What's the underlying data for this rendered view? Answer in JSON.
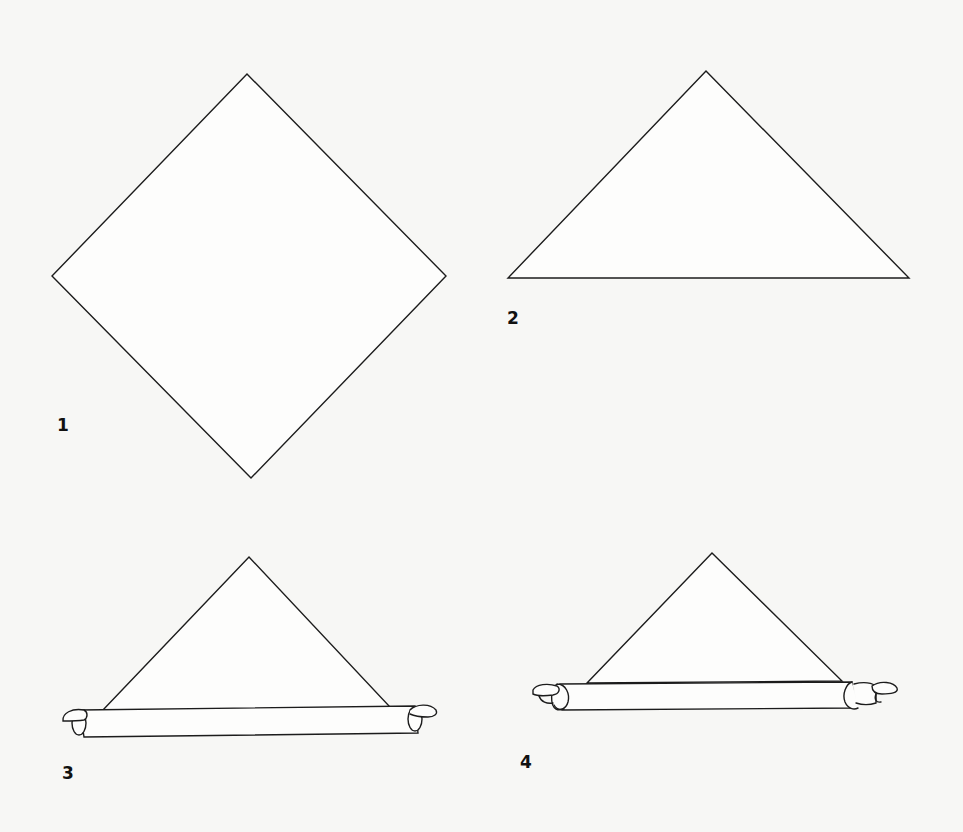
{
  "diagram": {
    "type": "step-by-step folding/rolling instructions",
    "background_color": "#f7f7f5",
    "line_color": "#1c1c1c",
    "steps": [
      {
        "label": "1",
        "shape": "square turned on point (diamond)",
        "vertices": {
          "top": [
            247,
            74
          ],
          "left": [
            52,
            276
          ],
          "right": [
            446,
            276
          ],
          "bottom": [
            251,
            478
          ]
        }
      },
      {
        "label": "2",
        "shape": "triangle (square folded in half diagonally)",
        "vertices": {
          "apex": [
            706,
            71
          ],
          "base_left": [
            508,
            278
          ],
          "base_right": [
            909,
            278
          ]
        }
      },
      {
        "label": "3",
        "shape": "triangle with base rolled into a tube, loose curled ends",
        "vertices": {
          "apex": [
            249,
            557
          ],
          "base_left": [
            102,
            711
          ],
          "base_right": [
            390,
            707
          ]
        },
        "tube": {
          "x_start": 77,
          "x_end": 418,
          "top": 709,
          "bottom": 736
        }
      },
      {
        "label": "4",
        "shape": "triangle with base rolled further, tightly rolled ends protruding",
        "vertices": {
          "apex": [
            712,
            553
          ],
          "base_left": [
            587,
            683
          ],
          "base_right": [
            842,
            681
          ]
        },
        "tube": {
          "x_start": 553,
          "x_end": 855,
          "top": 683,
          "bottom": 709
        }
      }
    ]
  }
}
